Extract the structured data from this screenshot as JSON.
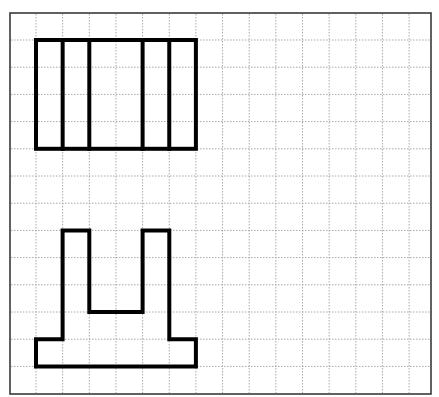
{
  "diagram": {
    "type": "grid-drawing",
    "frame": {
      "x": 10,
      "y": 13,
      "width": 421,
      "height": 381,
      "stroke": "#3a3a3a"
    },
    "grid": {
      "origin_x": 36,
      "origin_y": 40,
      "cell_w": 26.65,
      "cell_h": 27.2,
      "columns": 15,
      "rows": 13,
      "line_color": "#a8a8a8",
      "style": "dotted"
    },
    "shapes": [
      {
        "name": "top-rectangle-with-dividers",
        "description": "6x4 cell rectangle split by 4 vertical lines (gap in the middle column)",
        "cell_box": {
          "col0": 0,
          "row0": 0,
          "col1": 6,
          "row1": 4
        },
        "dividers_cols": [
          1,
          2,
          4,
          5
        ],
        "stroke": "#000000"
      },
      {
        "name": "bottom-pillar-shape",
        "description": "Base with two upright pillars (U / fork shape)",
        "cell_points": [
          [
            0,
            11
          ],
          [
            1,
            11
          ],
          [
            1,
            7
          ],
          [
            2,
            7
          ],
          [
            2,
            10
          ],
          [
            4,
            10
          ],
          [
            4,
            7
          ],
          [
            5,
            7
          ],
          [
            5,
            11
          ],
          [
            6,
            11
          ],
          [
            6,
            12
          ],
          [
            0,
            12
          ]
        ],
        "stroke": "#000000"
      }
    ]
  }
}
